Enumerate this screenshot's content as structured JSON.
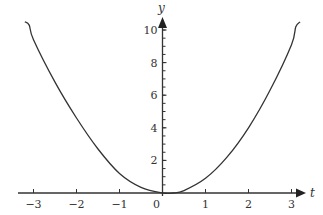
{
  "chart_data": {
    "type": "line",
    "title": "",
    "xlabel": "t",
    "ylabel": "y",
    "xlim": [
      -3.3,
      3.4
    ],
    "ylim": [
      0,
      10.6
    ],
    "grid": false,
    "legend": null,
    "x_ticks": [
      -3,
      -2,
      -1,
      0,
      1,
      2,
      3
    ],
    "x_tick_labels": [
      "−3",
      "−2",
      "−1",
      "0",
      "1",
      "2",
      "3"
    ],
    "y_ticks": [
      2,
      4,
      6,
      8,
      10
    ],
    "y_tick_labels": [
      "2",
      "4",
      "6",
      "8",
      "10"
    ],
    "y_minor_tick_step": 0.5,
    "series": [
      {
        "name": "curve",
        "color": "#333333",
        "x": [
          -3.2,
          -3.1,
          -3.0,
          -2.5,
          -2.0,
          -1.5,
          -1.0,
          -0.5,
          0.0,
          0.25,
          0.5,
          1.0,
          1.5,
          2.0,
          2.5,
          3.0,
          3.1,
          3.2
        ],
        "y": [
          10.5,
          10.3,
          9.4,
          6.8,
          4.6,
          2.7,
          1.2,
          0.35,
          0.0,
          0.0,
          0.15,
          0.9,
          2.2,
          4.0,
          6.3,
          9.1,
          10.2,
          10.5
        ]
      }
    ]
  },
  "axes": {
    "x_label": "t",
    "y_label": "y"
  }
}
